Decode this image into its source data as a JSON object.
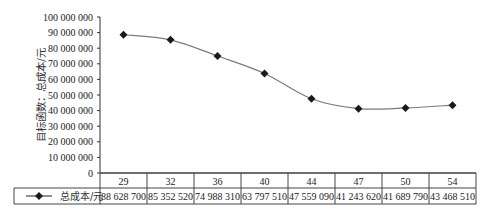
{
  "chart_data": {
    "type": "line",
    "title": "",
    "xlabel": "",
    "ylabel": "目标函数：总成本/元",
    "categories": [
      "29",
      "32",
      "36",
      "40",
      "44",
      "47",
      "50",
      "54"
    ],
    "series": [
      {
        "name": "总成本/元",
        "values": [
          88628700,
          85352520,
          74988310,
          63797510,
          47559090,
          41243620,
          41689790,
          43468510
        ],
        "display_values": [
          "88 628 700",
          "85 352 520",
          "74 988 310",
          "63 797 510",
          "47 559 090",
          "41 243 620",
          "41 689 790",
          "43 468 510"
        ],
        "marker": "diamond",
        "line_style": "smooth",
        "color": "#1a1a1a",
        "line_color": "#7a7a7a"
      }
    ],
    "ylim": [
      0,
      100000000
    ],
    "yticks": [
      0,
      10000000,
      20000000,
      30000000,
      40000000,
      50000000,
      60000000,
      70000000,
      80000000,
      90000000,
      100000000
    ],
    "ytick_labels": [
      "0",
      "10 000 000",
      "20 000 000",
      "30 000 000",
      "40 000 000",
      "50 000 000",
      "60 000 000",
      "70 000 000",
      "80 000 000",
      "90 000 000",
      "100 000 000"
    ],
    "grid": false,
    "legend_position": "data-table",
    "data_table": true
  }
}
